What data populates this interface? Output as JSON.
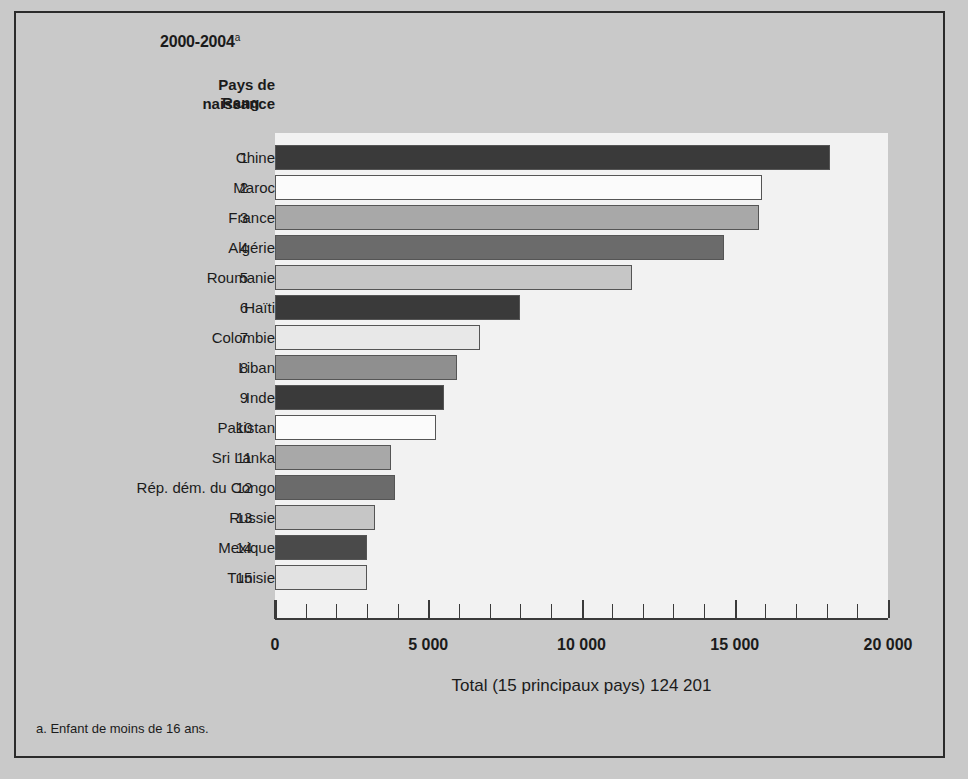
{
  "header": {
    "period": "2000-2004",
    "period_footnote_marker": "a",
    "col_country_line1": "Pays de",
    "col_country_line2": "naissance",
    "col_rank": "Rang"
  },
  "footnote": "a. Enfant de moins de 16 ans.",
  "axis_title": "Total (15 principaux pays) 124 201",
  "colors": {
    "page_bg": "#c9c9c9",
    "frame_border": "#2b2b2b",
    "plot_bg": "#f2f2f2",
    "axis": "#3a3a3a",
    "shade_dark": "#3a3a3a",
    "shade_white": "#fbfbfb",
    "shade_mid": "#a8a8a8",
    "shade_darkgray": "#6b6b6b",
    "shade_light": "#c6c6c6"
  },
  "chart_data": {
    "type": "bar",
    "orientation": "horizontal",
    "title": "2000-2004",
    "xlabel": "Total (15 principaux pays) 124 201",
    "ylabel": "Pays de naissance",
    "xlim": [
      0,
      20000
    ],
    "xticks": [
      0,
      5000,
      10000,
      15000,
      20000
    ],
    "xticklabels": [
      "0",
      "5 000",
      "10 000",
      "15 000",
      "20 000"
    ],
    "minor_tick_step": 1000,
    "grid": false,
    "legend": "none",
    "total": 124201,
    "categories": [
      "Chine",
      "Maroc",
      "France",
      "Algérie",
      "Roumanie",
      "Haïti",
      "Colombie",
      "Liban",
      "Inde",
      "Pakistan",
      "Sri Lanka",
      "Rép. dém. du Congo",
      "Russie",
      "Mexique",
      "Tunisie"
    ],
    "ranks": [
      1,
      2,
      3,
      4,
      5,
      6,
      7,
      8,
      9,
      10,
      11,
      12,
      13,
      14,
      15
    ],
    "values": [
      18100,
      15900,
      15800,
      14650,
      11650,
      8000,
      6700,
      5950,
      5500,
      5250,
      3800,
      3900,
      3250,
      3000,
      3000
    ],
    "bar_fills": [
      "#3a3a3a",
      "#fbfbfb",
      "#a8a8a8",
      "#6b6b6b",
      "#c6c6c6",
      "#3a3a3a",
      "#e8e8e8",
      "#8f8f8f",
      "#3a3a3a",
      "#fbfbfb",
      "#a8a8a8",
      "#6b6b6b",
      "#c6c6c6",
      "#4a4a4a",
      "#e2e2e2"
    ]
  }
}
